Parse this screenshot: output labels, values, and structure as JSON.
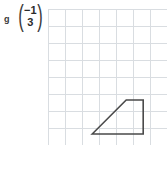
{
  "exercise": {
    "label": "g",
    "vector": {
      "x_component": "−1",
      "y_component": "3",
      "left_paren": "(",
      "right_paren": ")"
    }
  },
  "grid": {
    "columns": 7,
    "rows": 8,
    "cell_size": 17,
    "line_color": "#d9dde1",
    "origin_x": 48,
    "origin_y": 9,
    "width": 119,
    "height": 136
  },
  "shape": {
    "name": "trapezoid",
    "stroke_color": "#4a4a4a",
    "fill": "none",
    "stroke_width": 1.6,
    "vertices_grid": [
      [
        2.6,
        7.35
      ],
      [
        4.6,
        5.35
      ],
      [
        5.6,
        5.35
      ],
      [
        5.6,
        7.35
      ]
    ],
    "vertices_px": [
      [
        44.2,
        124.95
      ],
      [
        78.2,
        90.95
      ],
      [
        95.2,
        90.95
      ],
      [
        95.2,
        124.95
      ]
    ],
    "points_attr": "44.2,124.95 78.2,90.95 95.2,90.95 95.2,124.95"
  },
  "colors": {
    "background": "#ffffff",
    "grid_line": "#d9dde1",
    "shape_stroke": "#4a4a4a",
    "text": "#2b2b2b"
  }
}
